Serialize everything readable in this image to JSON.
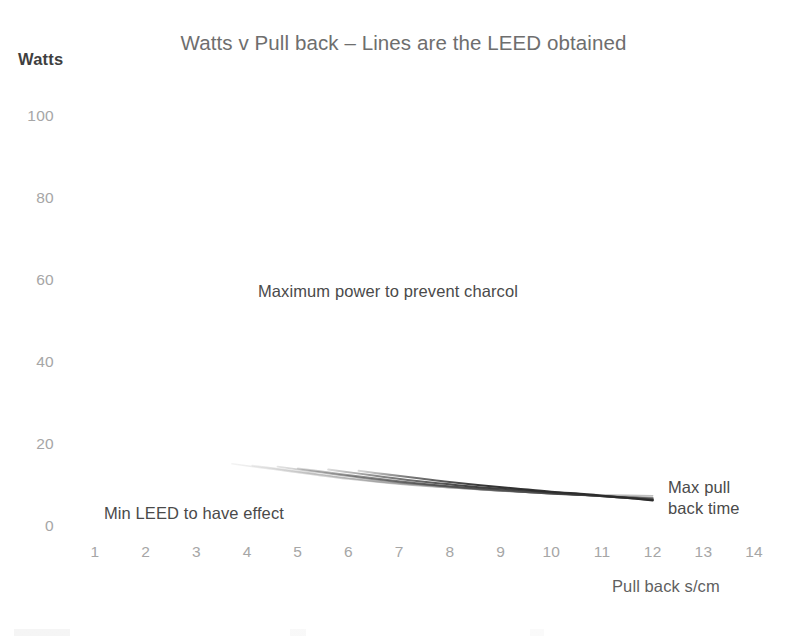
{
  "chart_data": {
    "type": "line",
    "title": "Watts v Pull back – Lines are the LEED obtained",
    "xlabel": "Pull back s/cm",
    "ylabel": "Watts",
    "xlim": [
      0.5,
      14.5
    ],
    "ylim": [
      0,
      100
    ],
    "grid": false,
    "legend": "none",
    "xticks": [
      "1",
      "2",
      "3",
      "4",
      "5",
      "6",
      "7",
      "8",
      "9",
      "10",
      "11",
      "12",
      "13",
      "14"
    ],
    "yticks": [
      "0",
      "20",
      "40",
      "60",
      "80",
      "100"
    ],
    "annotations": [
      {
        "id": "max-power",
        "text": "Maximum power to prevent charcol",
        "x": 6.6,
        "y": 57
      },
      {
        "id": "min-leed",
        "text": "Min LEED to have effect",
        "x": 4.1,
        "y": 7
      },
      {
        "id": "max-pull",
        "text": "Max pull\nback time",
        "x": 13.3,
        "y": 13
      }
    ],
    "series": [
      {
        "name": "LEED 1",
        "color": "#bfbfbf",
        "width": 1.5,
        "points": [
          [
            3.7,
            15.4
          ],
          [
            4.2,
            14.6
          ],
          [
            4.8,
            13.6
          ],
          [
            5.4,
            12.6
          ],
          [
            6.0,
            11.7
          ],
          [
            6.8,
            10.7
          ],
          [
            7.6,
            9.9
          ],
          [
            8.5,
            9.2
          ],
          [
            9.4,
            8.6
          ],
          [
            10.4,
            8.1
          ],
          [
            11.2,
            7.8
          ],
          [
            12.0,
            7.6
          ]
        ]
      },
      {
        "name": "LEED 2",
        "color": "#9e9e9e",
        "width": 1.6,
        "points": [
          [
            4.1,
            15.0
          ],
          [
            4.6,
            14.2
          ],
          [
            5.2,
            13.2
          ],
          [
            5.8,
            12.2
          ],
          [
            6.5,
            11.2
          ],
          [
            7.3,
            10.3
          ],
          [
            8.1,
            9.5
          ],
          [
            9.0,
            8.8
          ],
          [
            9.9,
            8.2
          ],
          [
            10.8,
            7.7
          ],
          [
            11.5,
            7.4
          ],
          [
            12.0,
            7.2
          ]
        ]
      },
      {
        "name": "LEED 3",
        "color": "#6b6b6b",
        "width": 1.8,
        "points": [
          [
            4.6,
            14.7
          ],
          [
            5.1,
            13.9
          ],
          [
            5.7,
            12.9
          ],
          [
            6.3,
            11.9
          ],
          [
            7.0,
            10.9
          ],
          [
            7.8,
            10.0
          ],
          [
            8.6,
            9.2
          ],
          [
            9.5,
            8.5
          ],
          [
            10.3,
            8.0
          ],
          [
            11.1,
            7.5
          ],
          [
            11.6,
            7.2
          ],
          [
            12.0,
            7.0
          ]
        ]
      },
      {
        "name": "LEED 4",
        "color": "#4f4f4f",
        "width": 1.9,
        "points": [
          [
            5.0,
            14.3
          ],
          [
            5.5,
            13.5
          ],
          [
            6.1,
            12.5
          ],
          [
            6.7,
            11.6
          ],
          [
            7.4,
            10.6
          ],
          [
            8.2,
            9.7
          ],
          [
            9.0,
            9.0
          ],
          [
            9.8,
            8.3
          ],
          [
            10.6,
            7.8
          ],
          [
            11.3,
            7.3
          ],
          [
            11.7,
            7.0
          ],
          [
            12.0,
            6.8
          ]
        ]
      },
      {
        "name": "LEED 5",
        "color": "#3a3a3a",
        "width": 2.0,
        "points": [
          [
            5.6,
            14.0
          ],
          [
            6.1,
            13.2
          ],
          [
            6.7,
            12.2
          ],
          [
            7.3,
            11.3
          ],
          [
            8.0,
            10.4
          ],
          [
            8.7,
            9.6
          ],
          [
            9.5,
            8.9
          ],
          [
            10.2,
            8.2
          ],
          [
            10.9,
            7.6
          ],
          [
            11.5,
            7.1
          ],
          [
            11.8,
            6.8
          ],
          [
            12.0,
            6.6
          ]
        ]
      },
      {
        "name": "LEED 6",
        "color": "#2b2b2b",
        "width": 2.1,
        "points": [
          [
            6.2,
            13.7
          ],
          [
            6.7,
            12.9
          ],
          [
            7.3,
            12.0
          ],
          [
            7.9,
            11.1
          ],
          [
            8.6,
            10.2
          ],
          [
            9.3,
            9.4
          ],
          [
            10.0,
            8.6
          ],
          [
            10.7,
            8.0
          ],
          [
            11.2,
            7.4
          ],
          [
            11.6,
            7.0
          ],
          [
            11.8,
            6.7
          ],
          [
            12.0,
            6.5
          ]
        ]
      }
    ]
  }
}
